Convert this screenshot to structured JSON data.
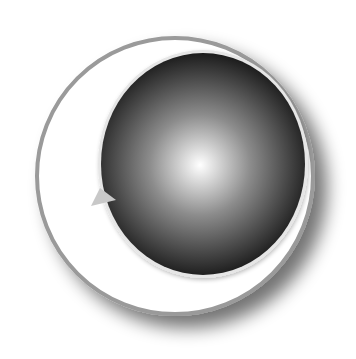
{
  "diagram": {
    "type": "orbit-illustration",
    "canvas": {
      "width": 356,
      "height": 359,
      "background": "#ffffff"
    },
    "outer_ring": {
      "cx": 175,
      "cy": 176,
      "r": 138,
      "fill": "#ffffff",
      "stroke": "#9a9a9a",
      "stroke_width": 4,
      "shadow_color": "#5a5a5a"
    },
    "inner_sphere": {
      "cx": 203,
      "cy": 164,
      "rx": 102,
      "ry": 111,
      "rim_color": "#e6e6e6",
      "gradient": {
        "center_color": "#ffffff",
        "mid_color": "#8c8c8c",
        "edge_color": "#1c1c1c",
        "highlight_cx": 200,
        "highlight_cy": 165
      }
    },
    "arrow": {
      "points": "91,206 116,200 100,188",
      "fill": "#c8c8c8",
      "direction": "right"
    }
  }
}
